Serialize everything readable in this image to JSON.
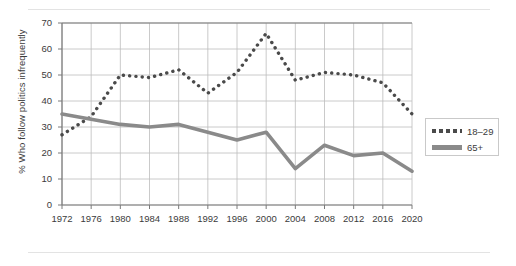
{
  "chart_data": {
    "type": "line",
    "title": "",
    "xlabel": "",
    "ylabel": "% Who follow politics infrequently",
    "categories": [
      1972,
      1976,
      1980,
      1984,
      1988,
      1992,
      1996,
      2000,
      2004,
      2008,
      2012,
      2016,
      2020
    ],
    "xtick_labels": [
      "1972",
      "1976",
      "1980",
      "1984",
      "1988",
      "1992",
      "1996",
      "2000",
      "2004",
      "2008",
      "2012",
      "2016",
      "2020"
    ],
    "ytick_labels": [
      "0",
      "10",
      "20",
      "30",
      "40",
      "50",
      "60",
      "70"
    ],
    "ytick_values": [
      0,
      10,
      20,
      30,
      40,
      50,
      60,
      70
    ],
    "ylim": [
      0,
      70
    ],
    "xlim": [
      1972,
      2020
    ],
    "grid": true,
    "legend_position": "right",
    "series": [
      {
        "name": "18–29",
        "style": "dotted",
        "color": "#4a4a4a",
        "values": [
          27,
          34,
          50,
          49,
          52,
          43,
          51,
          66,
          48,
          51,
          50,
          47,
          35
        ]
      },
      {
        "name": "65+",
        "style": "solid",
        "color": "#8a8a8a",
        "values": [
          35,
          33,
          31,
          30,
          31,
          28,
          25,
          28,
          14,
          23,
          19,
          20,
          13
        ]
      }
    ]
  },
  "legend": {
    "entries": [
      {
        "label": "18–29",
        "swatch": "dotted-line-swatch"
      },
      {
        "label": "65+",
        "swatch": "solid-line-swatch"
      }
    ]
  },
  "colors": {
    "series_young": "#4a4a4a",
    "series_old": "#8a8a8a",
    "grid": "#bdbdbd",
    "axis": "#7a7a7a",
    "text": "#3b3b3b",
    "rule": "#e3e3e3",
    "background": "#ffffff"
  }
}
